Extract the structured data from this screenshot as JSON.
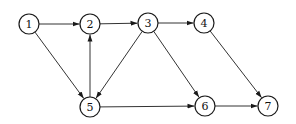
{
  "diagram": {
    "type": "directed-graph",
    "nodes": [
      {
        "id": "1",
        "label": "1",
        "x": 29,
        "y": 24
      },
      {
        "id": "2",
        "label": "2",
        "x": 90,
        "y": 24
      },
      {
        "id": "3",
        "label": "3",
        "x": 148,
        "y": 23
      },
      {
        "id": "4",
        "label": "4",
        "x": 204,
        "y": 23
      },
      {
        "id": "5",
        "label": "5",
        "x": 90,
        "y": 107
      },
      {
        "id": "6",
        "label": "6",
        "x": 205,
        "y": 106
      },
      {
        "id": "7",
        "label": "7",
        "x": 268,
        "y": 106
      }
    ],
    "edges": [
      {
        "from": "1",
        "to": "2"
      },
      {
        "from": "2",
        "to": "3"
      },
      {
        "from": "3",
        "to": "4"
      },
      {
        "from": "1",
        "to": "5"
      },
      {
        "from": "5",
        "to": "2"
      },
      {
        "from": "3",
        "to": "5"
      },
      {
        "from": "3",
        "to": "6"
      },
      {
        "from": "5",
        "to": "6"
      },
      {
        "from": "4",
        "to": "7"
      },
      {
        "from": "6",
        "to": "7"
      }
    ],
    "node_radius": 10,
    "colors": {
      "stroke": "#1a1a1a",
      "fill": "#ffffff"
    }
  }
}
